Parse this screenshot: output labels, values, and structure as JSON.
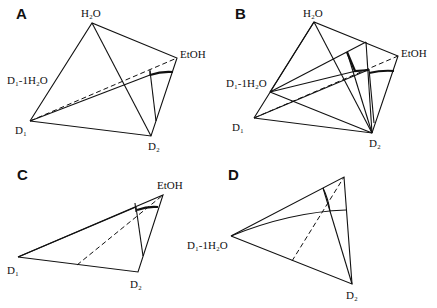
{
  "panels": [
    {
      "id": "A",
      "labels": {
        "h2o": "H₂O",
        "etoh": "EtOH",
        "d1": "D₁",
        "d2": "D₂",
        "d1_1h2o": "D₁-1H₂O"
      }
    },
    {
      "id": "B",
      "labels": {
        "h2o": "H₂O",
        "etoh": "EtOH",
        "d1": "D₁",
        "d2": "D₂",
        "d1_1h2o": "D₁-1H₂O"
      }
    },
    {
      "id": "C",
      "labels": {
        "etoh": "EtOH",
        "d1": "D₁",
        "d2": "D₂"
      }
    },
    {
      "id": "D",
      "labels": {
        "d1_1h2o": "D₁-1H₂O",
        "d2": "D₂"
      }
    }
  ]
}
